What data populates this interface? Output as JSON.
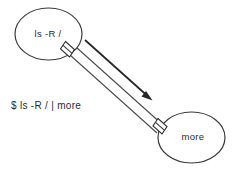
{
  "diagram": {
    "type": "pipeline-diagram",
    "background_color": "#ffffff",
    "stroke_color": "#3a3a3a",
    "text_color": "#2b2b2b",
    "nodes": [
      {
        "id": "producer",
        "label": "ls -R /",
        "shape": "ellipse",
        "cx": 48.5,
        "cy": 34,
        "rx": 33.5,
        "ry": 26,
        "label_x": 48,
        "label_y": 37
      },
      {
        "id": "consumer",
        "label": "more",
        "shape": "ellipse",
        "cx": 191.5,
        "cy": 137.5,
        "rx": 33.5,
        "ry": 25.5,
        "label_x": 193,
        "label_y": 140
      }
    ],
    "connector": {
      "name": "pipe",
      "from": "producer",
      "to": "consumer",
      "style": "double-line-tube",
      "fittings": 2
    },
    "arrow": {
      "name": "data-flow-arrow",
      "direction": "down-right",
      "from_x": 85,
      "from_y": 40,
      "to_x": 152,
      "to_y": 100
    },
    "command": {
      "label": "$ ls -R / | more",
      "x": 11,
      "y": 109
    }
  }
}
